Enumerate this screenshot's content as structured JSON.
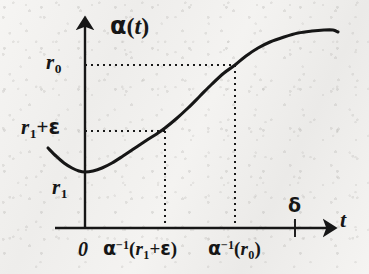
{
  "figure": {
    "title": "",
    "background_color": "#f2f1ef",
    "ink_color": "#161616"
  },
  "axes": {
    "y_axis_label": "α(t)",
    "x_axis_label": "t",
    "origin_label": "0",
    "x_axis_tick_label": "δ"
  },
  "labels": {
    "alpha": "α",
    "t": "t",
    "r": "r",
    "zero_sub": "0",
    "one_sub": "1",
    "plus": "+",
    "epsilon": "ε",
    "minus_one_sup": "−1",
    "open_paren": "(",
    "close_paren": ")",
    "zero": "0",
    "delta": "δ"
  },
  "y_ticks": [
    {
      "label": "r₀",
      "value_name": "r_0",
      "y_px": 65
    },
    {
      "label": "r₁ + ε",
      "value_name": "r_1_plus_epsilon",
      "y_px": 131
    },
    {
      "label": "r₁",
      "value_name": "r_1",
      "y_px": 172
    }
  ],
  "x_ticks": [
    {
      "label": "0",
      "x_px": 85
    },
    {
      "label": "α⁻¹(r₁+ε)",
      "x_px": 165
    },
    {
      "label": "α⁻¹(r₀)",
      "x_px": 235
    },
    {
      "label": "δ",
      "x_px": 295
    }
  ],
  "chart_data": {
    "type": "line",
    "title": "",
    "xlabel": "t",
    "ylabel": "α(t)",
    "grid": false,
    "legend": null,
    "axis_origin_px": {
      "x": 85,
      "y": 228
    },
    "series": [
      {
        "name": "α(t)",
        "points_px": [
          [
            48,
            148
          ],
          [
            56,
            156
          ],
          [
            64,
            163
          ],
          [
            72,
            168
          ],
          [
            79,
            171
          ],
          [
            85,
            172
          ],
          [
            93,
            171
          ],
          [
            102,
            168
          ],
          [
            112,
            163
          ],
          [
            123,
            156
          ],
          [
            135,
            148
          ],
          [
            147,
            140
          ],
          [
            158,
            133
          ],
          [
            165,
            128
          ],
          [
            176,
            119
          ],
          [
            188,
            108
          ],
          [
            200,
            96
          ],
          [
            212,
            84
          ],
          [
            224,
            73
          ],
          [
            235,
            65
          ],
          [
            246,
            56
          ],
          [
            258,
            48
          ],
          [
            270,
            42
          ],
          [
            284,
            37
          ],
          [
            298,
            33
          ],
          [
            312,
            31
          ],
          [
            324,
            30
          ],
          [
            333,
            30
          ],
          [
            338,
            32
          ]
        ]
      }
    ],
    "annotations": [
      {
        "type": "h-dotted",
        "label": "r₀",
        "from_px": [
          85,
          65
        ],
        "to_px": [
          235,
          65
        ]
      },
      {
        "type": "v-dotted",
        "label": "α⁻¹(r₀)",
        "from_px": [
          235,
          65
        ],
        "to_px": [
          235,
          228
        ]
      },
      {
        "type": "h-dotted",
        "label": "r₁ + ε",
        "from_px": [
          85,
          131
        ],
        "to_px": [
          165,
          131
        ]
      },
      {
        "type": "v-dotted",
        "label": "α⁻¹(r₁+ε)",
        "from_px": [
          165,
          131
        ],
        "to_px": [
          165,
          228
        ]
      },
      {
        "type": "tick",
        "label": "δ",
        "at_px": [
          295,
          228
        ]
      }
    ]
  }
}
